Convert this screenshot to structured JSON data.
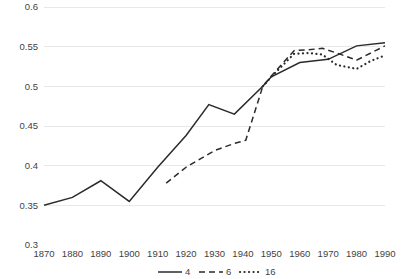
{
  "chart_data": {
    "type": "line",
    "title": "",
    "xlabel": "",
    "ylabel": "",
    "xlim": [
      1870,
      1990
    ],
    "ylim": [
      0.3,
      0.6
    ],
    "grid": true,
    "legend_position": "bottom",
    "x_ticks": [
      "1870",
      "1880",
      "1890",
      "1900",
      "1910",
      "1920",
      "1930",
      "1940",
      "1950",
      "1960",
      "1970",
      "1980",
      "1990"
    ],
    "y_ticks": [
      "0.3",
      "0.35",
      "0.4",
      "0.45",
      "0.5",
      "0.55",
      "0.6"
    ],
    "series": [
      {
        "name": "4",
        "style": "solid",
        "x": [
          1870,
          1880,
          1890,
          1900,
          1910,
          1920,
          1928,
          1937,
          1947,
          1950,
          1960,
          1970,
          1980,
          1990
        ],
        "values": [
          0.35,
          0.36,
          0.381,
          0.355,
          0.398,
          0.438,
          0.477,
          0.465,
          0.5,
          0.512,
          0.53,
          0.534,
          0.551,
          0.555
        ]
      },
      {
        "name": "6",
        "style": "dashed",
        "x": [
          1913,
          1920,
          1930,
          1937,
          1941,
          1947,
          1950,
          1958,
          1963,
          1968,
          1973,
          1980,
          1990
        ],
        "values": [
          0.378,
          0.398,
          0.419,
          0.428,
          0.432,
          0.5,
          0.513,
          0.545,
          0.546,
          0.548,
          0.542,
          0.533,
          0.551
        ]
      },
      {
        "name": "16",
        "style": "dotted",
        "x": [
          1947,
          1950,
          1958,
          1963,
          1968,
          1973,
          1980,
          1985,
          1990
        ],
        "values": [
          0.5,
          0.512,
          0.541,
          0.542,
          0.54,
          0.527,
          0.522,
          0.532,
          0.539
        ]
      }
    ]
  },
  "legend": {
    "items": [
      {
        "label": "4",
        "style": "solid"
      },
      {
        "label": "6",
        "style": "dashed"
      },
      {
        "label": "16",
        "style": "dotted"
      }
    ]
  },
  "colors": {
    "line": "#2b2b2b",
    "grid": "#e8e8e8",
    "text": "#3f3f3f",
    "background": "#ffffff"
  }
}
